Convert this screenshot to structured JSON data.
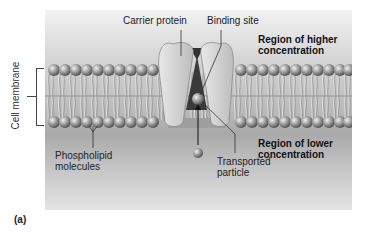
{
  "figure": {
    "panel_label": "(a)",
    "labels": {
      "carrier_protein": "Carrier protein",
      "binding_site": "Binding site",
      "region_higher_line1": "Region of higher",
      "region_higher_line2": "concentration",
      "region_lower_line1": "Region of lower",
      "region_lower_line2": "concentration",
      "cell_membrane": "Cell membrane",
      "phospholipid_line1": "Phospholipid",
      "phospholipid_line2": "molecules",
      "transported_line1": "Transported",
      "transported_line2": "particle"
    },
    "colors": {
      "background_top": "#f2f2f2",
      "background_mid": "#a9a9a9",
      "phospholipid_head": "#8a8a8a",
      "protein": "#d6d6d6",
      "protein_shadow": "#555555"
    }
  }
}
